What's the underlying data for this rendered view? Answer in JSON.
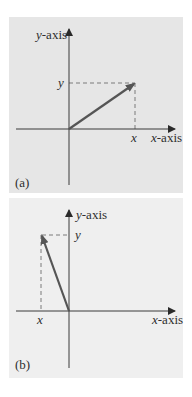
{
  "figure": {
    "panels": [
      {
        "id": "a",
        "caption": "(a)",
        "y_axis_label_var": "y",
        "y_axis_label_rest": "-axis",
        "x_axis_label_var": "x",
        "x_axis_label_rest": "-axis",
        "x_component_label": "x",
        "y_component_label": "y",
        "vector_direction": "first quadrant (positive x, positive y)"
      },
      {
        "id": "b",
        "caption": "(b)",
        "y_axis_label_var": "y",
        "y_axis_label_rest": "-axis",
        "x_axis_label_var": "x",
        "x_axis_label_rest": "-axis",
        "x_component_label": "x",
        "y_component_label": "y",
        "vector_direction": "second quadrant (negative x, positive y)"
      }
    ],
    "colors": {
      "panel_a_background": "#e6e6e6",
      "panel_b_background": "#efefef",
      "axis": "#3a3a3a",
      "vector": "#555555",
      "dashed": "#7a7a7a",
      "text": "#2e2e2e"
    }
  }
}
